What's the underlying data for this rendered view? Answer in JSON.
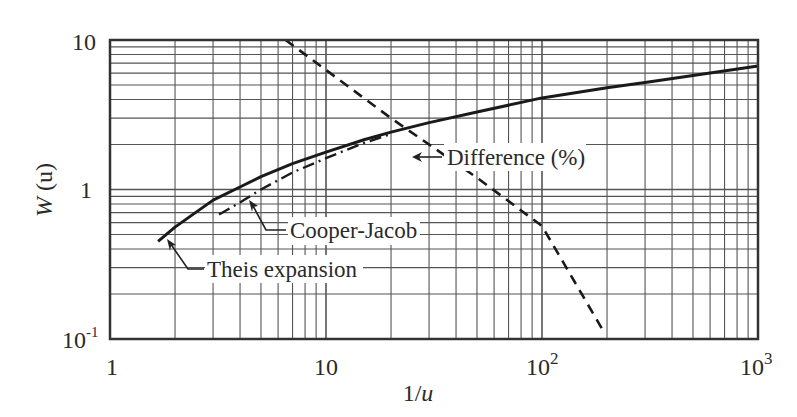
{
  "chart_data": {
    "type": "line",
    "title": "",
    "xlabel": "1/u",
    "ylabel": "W (u)",
    "xscale": "log",
    "yscale": "log",
    "xlim": [
      1,
      1000
    ],
    "ylim": [
      0.1,
      10
    ],
    "grid": true,
    "x_ticks": [
      {
        "value": 1,
        "label": "1"
      },
      {
        "value": 10,
        "label": "10"
      },
      {
        "value": 100,
        "label": "10",
        "sup": "2"
      },
      {
        "value": 1000,
        "label": "10",
        "sup": "3"
      }
    ],
    "y_ticks": [
      {
        "value": 10,
        "label": "10"
      },
      {
        "value": 1,
        "label": "1"
      },
      {
        "value": 0.1,
        "label": "10",
        "sup": "-1"
      }
    ],
    "series": [
      {
        "name": "Theis expansion",
        "style": "solid",
        "x": [
          1.67,
          2,
          3,
          4,
          5,
          7,
          10,
          15,
          20,
          30,
          50,
          100,
          200,
          300,
          500,
          1000
        ],
        "y": [
          0.45,
          0.56,
          0.85,
          1.04,
          1.22,
          1.49,
          1.78,
          2.15,
          2.42,
          2.8,
          3.3,
          4.1,
          4.8,
          5.2,
          5.8,
          6.7
        ]
      },
      {
        "name": "Cooper-Jacob",
        "style": "dash-dot",
        "x": [
          3.2,
          4,
          5,
          7,
          10,
          15,
          20
        ],
        "y": [
          0.68,
          0.82,
          1.0,
          1.3,
          1.62,
          2.05,
          2.35
        ]
      },
      {
        "name": "Difference (%)",
        "style": "dashed",
        "x": [
          6.5,
          10,
          20,
          50,
          100,
          196
        ],
        "y": [
          10,
          6.3,
          3.0,
          1.2,
          0.57,
          0.108
        ]
      }
    ],
    "annotations": [
      {
        "text": "Difference (%)",
        "target_series": "Difference (%)"
      },
      {
        "text": "Cooper-Jacob",
        "target_series": "Cooper-Jacob"
      },
      {
        "text": "Theis expansion",
        "target_series": "Theis expansion"
      }
    ]
  },
  "axes": {
    "xlabel_main": "1/",
    "xlabel_var": "u",
    "ylabel_main": "W",
    "ylabel_var": "(u)"
  },
  "labels": {
    "difference": "Difference (%)",
    "cooper_jacob": "Cooper-Jacob",
    "theis": "Theis expansion"
  },
  "ticks": {
    "x0": "1",
    "x1": "10",
    "x2": "10",
    "x2sup": "2",
    "x3": "10",
    "x3sup": "3",
    "y10": "10",
    "y1": "1",
    "y01": "10",
    "y01sup": "-1"
  }
}
